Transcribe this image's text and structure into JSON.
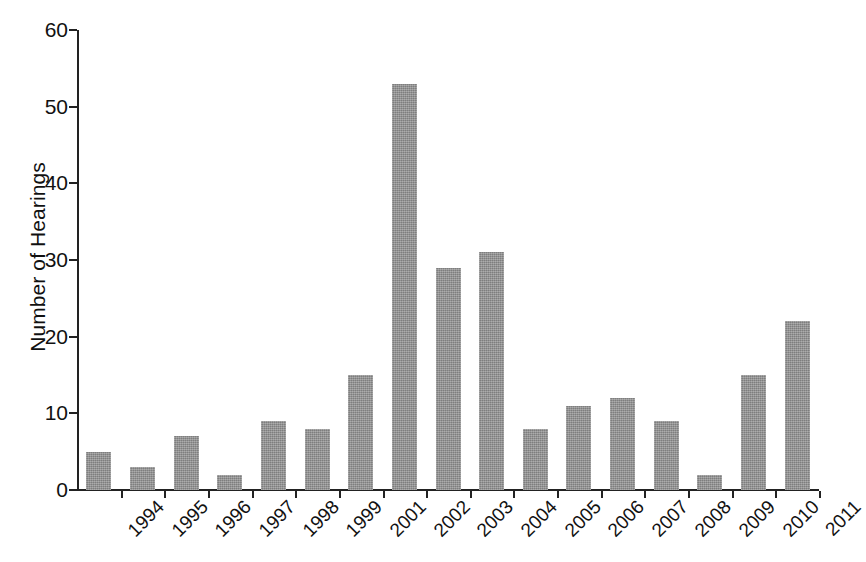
{
  "chart_data": {
    "type": "bar",
    "title": "",
    "subtitle": "",
    "xlabel": "",
    "ylabel": "Number of Hearings",
    "categories": [
      "1994",
      "1995",
      "1996",
      "1997",
      "1998",
      "1999",
      "2001",
      "2002",
      "2003",
      "2004",
      "2005",
      "2006",
      "2007",
      "2008",
      "2009",
      "2010",
      "2011"
    ],
    "values": [
      5,
      3,
      7,
      2,
      9,
      8,
      15,
      53,
      29,
      31,
      8,
      11,
      12,
      9,
      2,
      15,
      22
    ],
    "ylim": [
      0,
      60
    ],
    "y_ticks": [
      0,
      10,
      20,
      30,
      40,
      50,
      60
    ],
    "y_tick_labels": [
      "0",
      "10",
      "20",
      "30",
      "40",
      "50",
      "60"
    ],
    "grid": false,
    "legend": false,
    "legend_position": "none",
    "bar_color": "#8d8d8d",
    "axis_color": "#222222",
    "text_color": "#111111",
    "background_color": "#ffffff",
    "x_label_rotation": -45
  }
}
